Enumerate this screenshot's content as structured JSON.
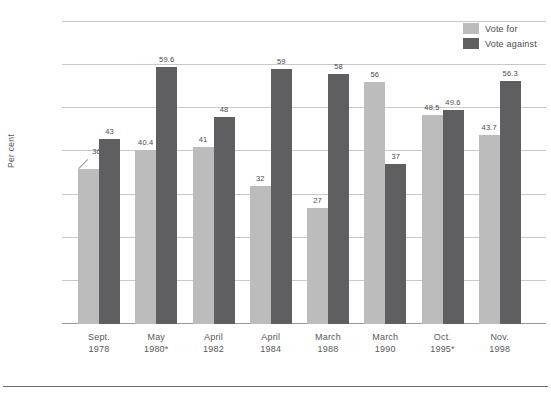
{
  "chart_data": {
    "type": "bar",
    "title": "",
    "subtitle": "",
    "xlabel": "",
    "ylabel": "Per cent",
    "ylim": [
      0,
      70
    ],
    "yticks": [
      0,
      10,
      20,
      30,
      40,
      50,
      60,
      70
    ],
    "ytick_labels": [
      "0",
      "10",
      "20",
      "30",
      "40",
      "50",
      "60",
      "70"
    ],
    "grid": true,
    "legend_position": "top-right",
    "categories": [
      {
        "line1": "Sept.",
        "line2": "1978"
      },
      {
        "line1": "May",
        "line2": "1980*"
      },
      {
        "line1": "April",
        "line2": "1982"
      },
      {
        "line1": "April",
        "line2": "1984"
      },
      {
        "line1": "March",
        "line2": "1988"
      },
      {
        "line1": "March",
        "line2": "1990"
      },
      {
        "line1": "Oct.",
        "line2": "1995*"
      },
      {
        "line1": "Nov.",
        "line2": "1998"
      }
    ],
    "series": [
      {
        "name": "Vote for",
        "color": "#bcbcbc",
        "values": [
          36,
          40.4,
          41,
          32,
          27,
          56,
          48.5,
          43.7
        ],
        "labels": [
          "36",
          "40.4",
          "41",
          "32",
          "27",
          "56",
          "48.5",
          "43.7"
        ]
      },
      {
        "name": "Vote against",
        "color": "#5f5f61",
        "values": [
          43,
          59.6,
          48,
          59,
          58,
          37,
          49.6,
          56.3
        ],
        "labels": [
          "43",
          "59.6",
          "48",
          "59",
          "58",
          "37",
          "49.6",
          "56.3"
        ]
      }
    ]
  },
  "legend": {
    "items": [
      {
        "label": "Vote for",
        "key": "for"
      },
      {
        "label": "Vote against",
        "key": "against"
      }
    ]
  },
  "footer": {
    "caption": ""
  },
  "colors": {
    "vote_for": "#bcbcbc",
    "vote_against": "#5f5f61",
    "gridline": "#c8c8c8",
    "axis": "#9a9a9a",
    "text": "#58585a"
  }
}
